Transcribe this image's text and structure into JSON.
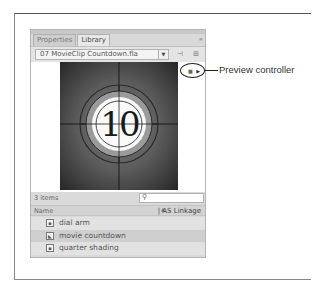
{
  "panel": {
    "tabs": [
      {
        "label": "Properties",
        "active": false
      },
      {
        "label": "Library",
        "active": true
      }
    ],
    "menu_icon": "≡",
    "file_select": {
      "value": "07 MovieClip Countdown.fla",
      "arrow": "▼"
    },
    "toolbar_buttons": [
      {
        "name": "pin-icon",
        "glyph": "⊣"
      },
      {
        "name": "new-library-icon",
        "glyph": "⊞"
      }
    ],
    "preview": {
      "countdown_number": "10",
      "controller": {
        "stop": "■",
        "play": "▶"
      }
    },
    "status": {
      "item_count": "3 items",
      "search_icon": "⚲",
      "search_value": ""
    },
    "columns": {
      "name": "Name",
      "sort_indicator": "▲",
      "linkage": "| AS Linkage"
    },
    "items": [
      {
        "label": "dial arm",
        "icon": "graphic-symbol",
        "selected": false
      },
      {
        "label": "movie countdown",
        "icon": "movieclip-symbol",
        "selected": true
      },
      {
        "label": "quarter shading",
        "icon": "graphic-symbol",
        "selected": false
      }
    ]
  },
  "callout": {
    "label": "Preview controller"
  },
  "colors": {
    "panel_bg": "#d9d9d9",
    "selected_row": "#cfcfcf",
    "callout": "#222222"
  }
}
